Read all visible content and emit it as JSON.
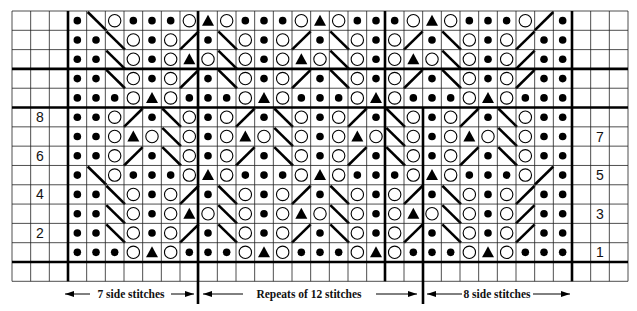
{
  "chart_data": {
    "type": "knitting-chart",
    "title": "",
    "legend": {
      "K": "dot (filled circle)",
      "O": "open circle",
      "T": "filled triangle",
      "L": "left-leaning diagonal (\\)",
      "R": "right-leaning diagonal (/)"
    },
    "columns": 27,
    "side_left_stitches": 7,
    "repeat_stitches": 12,
    "side_right_stitches": 8,
    "rows_top_to_bottom": [
      {
        "label": "",
        "pattern": "KLOKKKOTOKKKOTOKKKOTOKKKORK"
      },
      {
        "label": "",
        "pattern": "KKLOKORKLOKORKLOKORKLOKORKK"
      },
      {
        "label": "",
        "pattern": "KKLOKOTOLOKOTOLOKOTOLOKORKK"
      },
      {
        "label": "",
        "pattern": "KKLOKORKLOKORKLOKORKLOKORKK"
      },
      {
        "label": "",
        "pattern": "KKKOTOKKKOTOKKKOTOKKKOTOKKK"
      },
      {
        "label": "8",
        "pattern": "KKORKLOKORKLOKORKLOKORKLOKK"
      },
      {
        "label": "7",
        "pattern": "KKOTOLOKOTOLOKOTOLOKOTOLOKK"
      },
      {
        "label": "6",
        "pattern": "KKORKLOKORKLOKORKLOKORKLOKK"
      },
      {
        "label": "5",
        "pattern": "KLOKKKOTOKKKOTOKKKOTOKKKORK"
      },
      {
        "label": "4",
        "pattern": "KKLOKORKLOKORKLOKORKLOKORKK"
      },
      {
        "label": "3",
        "pattern": "KKLOKOTOLOKOTOLOKOTOLOKORKK"
      },
      {
        "label": "2",
        "pattern": "KKLOKORKLOKORKLOKORKLOKORKK"
      },
      {
        "label": "1",
        "pattern": "KKKOTOKKKOTOKKKOTOKKKOTOKKK"
      }
    ],
    "even_row_labels_side": "left",
    "odd_row_labels_side": "right"
  },
  "captions": {
    "left": "7 side stitches",
    "middle": "Repeats of 12 stitches",
    "right": "8 side stitches"
  }
}
